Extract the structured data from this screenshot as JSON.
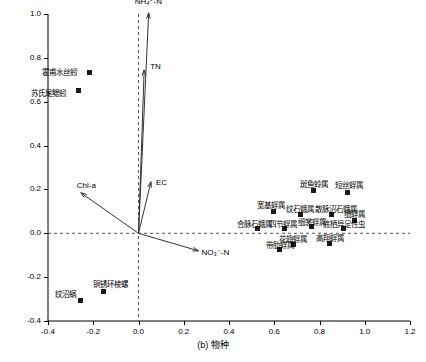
{
  "chart_data": {
    "type": "scatter",
    "title": "",
    "xlabel": "(b) 物种",
    "ylabel": "",
    "xlim": [
      -0.4,
      1.2
    ],
    "ylim": [
      -0.4,
      1.0
    ],
    "xticks": [
      "-0.4",
      "-0.2",
      "0.0",
      "0.2",
      "0.4",
      "0.6",
      "0.8",
      "1.0",
      "1.2"
    ],
    "yticks": [
      "-0.4",
      "-0.2",
      "0.0",
      "0.2",
      "0.4",
      "0.6",
      "0.8",
      "1.0"
    ],
    "grid": false,
    "legend": "none",
    "origin_lines": true,
    "species_points": [
      {
        "label": "纹沼蜗",
        "x": -0.255,
        "y": -0.305,
        "label_dx": -26,
        "label_dy": -12
      },
      {
        "label": "铜锈环棱螺",
        "x": -0.155,
        "y": -0.265,
        "label_dx": -10,
        "label_dy": -13
      },
      {
        "label": "斑鱼蛉属",
        "x": 0.775,
        "y": 0.195,
        "label_dx": -14,
        "label_dy": -13
      },
      {
        "label": "短丝蜉属",
        "x": 0.925,
        "y": 0.185,
        "label_dx": -13,
        "label_dy": -14
      },
      {
        "label": "宽基蜉属",
        "x": 0.595,
        "y": 0.1,
        "label_dx": -16,
        "label_dy": -12
      },
      {
        "label": "纹石蛾属",
        "x": 0.715,
        "y": 0.085,
        "label_dx": -14,
        "label_dy": -12
      },
      {
        "label": "散脉沼石蛾属",
        "x": 0.855,
        "y": 0.085,
        "label_dx": -17,
        "label_dy": -12
      },
      {
        "label": "细蜉属",
        "x": 0.955,
        "y": 0.06,
        "label_dx": -11,
        "label_dy": -12
      },
      {
        "label": "合脉石蛾属",
        "x": 0.525,
        "y": 0.02,
        "label_dx": -20,
        "label_dy": -11
      },
      {
        "label": "四节蜉属",
        "x": 0.645,
        "y": 0.02,
        "label_dx": -15,
        "label_dy": -11
      },
      {
        "label": "细裳蜉属",
        "x": 0.765,
        "y": 0.03,
        "label_dx": -14,
        "label_dy": -11
      },
      {
        "label": "底栖异足性虫",
        "x": 0.905,
        "y": 0.02,
        "label_dx": -20,
        "label_dy": -11
      },
      {
        "label": "花翅蜉属",
        "x": 0.685,
        "y": -0.05,
        "label_dx": -14,
        "label_dy": -11
      },
      {
        "label": "高翔蜉属",
        "x": 0.845,
        "y": -0.045,
        "label_dx": -14,
        "label_dy": -11
      },
      {
        "label": "带肋蜉属",
        "x": 0.625,
        "y": -0.075,
        "label_dx": -14,
        "label_dy": -11
      }
    ],
    "env_vectors": [
      {
        "label": "NH₄⁺-N",
        "x": 0.045,
        "y": 1.005,
        "label_dx": -14,
        "label_dy": -16
      },
      {
        "label": "TN",
        "x": 0.025,
        "y": 0.745,
        "label_dx": 6,
        "label_dy": -8
      },
      {
        "label": "EC",
        "x": 0.055,
        "y": 0.235,
        "label_dx": 5,
        "label_dy": -4
      },
      {
        "label": "Chl-a",
        "x": -0.255,
        "y": 0.185,
        "label_dx": -4,
        "label_dy": -12
      },
      {
        "label": "NO₃⁻-N",
        "x": 0.265,
        "y": -0.08,
        "label_dx": 3,
        "label_dy": -3
      }
    ],
    "env_points": [
      {
        "label": "霍甫水丝蚓",
        "x": -0.215,
        "y": 0.735,
        "label_dx": -48,
        "label_dy": -6
      },
      {
        "label": "苏氏尾鳃蚓",
        "x": -0.265,
        "y": 0.65,
        "label_dx": -48,
        "label_dy": -4
      }
    ]
  }
}
